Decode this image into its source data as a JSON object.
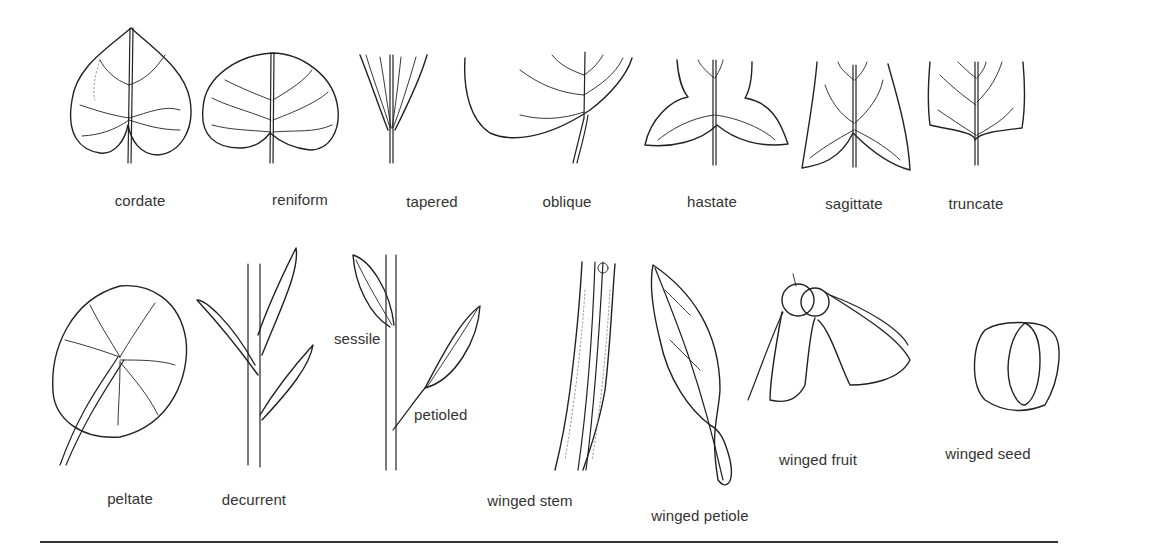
{
  "figure": {
    "rows": [
      {
        "row": 1,
        "items": [
          {
            "id": "cordate",
            "label": "cordate"
          },
          {
            "id": "reniform",
            "label": "reniform"
          },
          {
            "id": "tapered",
            "label": "tapered"
          },
          {
            "id": "oblique",
            "label": "oblique"
          },
          {
            "id": "hastate",
            "label": "hastate"
          },
          {
            "id": "sagittate",
            "label": "sagittate"
          },
          {
            "id": "truncate",
            "label": "truncate"
          }
        ]
      },
      {
        "row": 2,
        "items": [
          {
            "id": "peltate",
            "label": "peltate"
          },
          {
            "id": "decurrent",
            "label": "decurrent"
          },
          {
            "id": "sessile",
            "label": "sessile"
          },
          {
            "id": "petioled",
            "label": "petioled"
          },
          {
            "id": "winged-stem",
            "label": "winged stem"
          },
          {
            "id": "winged-petiole",
            "label": "winged petiole"
          },
          {
            "id": "winged-fruit",
            "label": "winged fruit"
          },
          {
            "id": "winged-seed",
            "label": "winged seed"
          }
        ]
      }
    ],
    "colors": {
      "line": "#222222",
      "background": "#ffffff",
      "text": "#333333"
    }
  }
}
